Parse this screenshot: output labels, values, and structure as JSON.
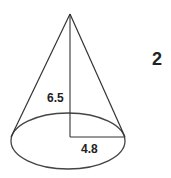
{
  "figure": {
    "shape": "cone",
    "problem_number": "2",
    "height_label": "6.5",
    "radius_label": "4.8",
    "stroke_color": "#333333",
    "text_color": "#222222",
    "background": "#ffffff"
  }
}
